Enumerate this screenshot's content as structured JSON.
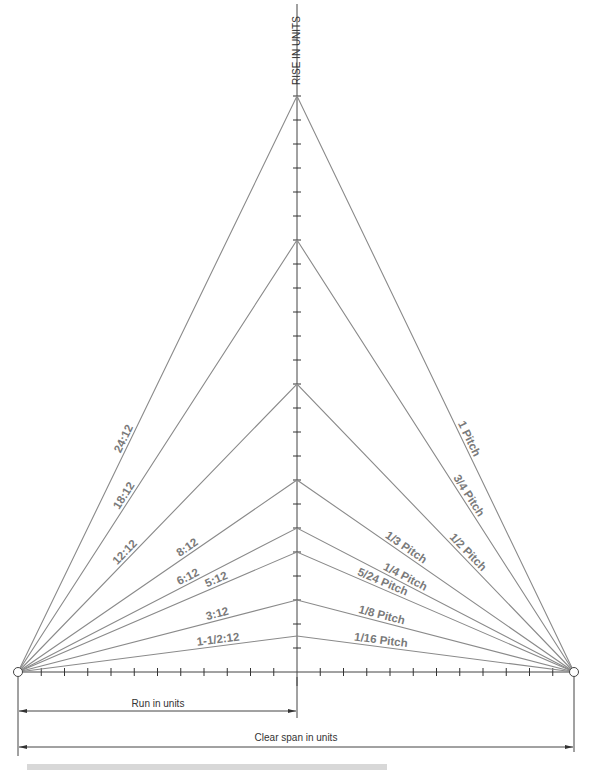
{
  "axis": {
    "vertical_label": "RISE IN UNITS"
  },
  "dimensions": {
    "run_label": "Run in units",
    "span_label": "Clear span in units"
  },
  "caption": {
    "note": "Figure caption clipped by bottom image edge; not legible"
  },
  "geometry": {
    "run_units": 12,
    "span_units": 24,
    "max_rise_units": 24
  },
  "left_labels": [
    {
      "text": "24:12",
      "rise": 24
    },
    {
      "text": "18:12",
      "rise": 18
    },
    {
      "text": "12:12",
      "rise": 12
    },
    {
      "text": "8:12",
      "rise": 8
    },
    {
      "text": "6:12",
      "rise": 6
    },
    {
      "text": "5:12",
      "rise": 5
    },
    {
      "text": "3:12",
      "rise": 3
    },
    {
      "text": "1-1/2:12",
      "rise": 1.5
    }
  ],
  "right_labels": [
    {
      "text": "1 Pitch",
      "rise": 24
    },
    {
      "text": "3/4 Pitch",
      "rise": 18
    },
    {
      "text": "1/2 Pitch",
      "rise": 12
    },
    {
      "text": "1/3 Pitch",
      "rise": 8
    },
    {
      "text": "1/4 Pitch",
      "rise": 6
    },
    {
      "text": "5/24 Pitch",
      "rise": 5
    },
    {
      "text": "1/8 Pitch",
      "rise": 3
    },
    {
      "text": "1/16 Pitch",
      "rise": 1.5
    }
  ],
  "colors": {
    "roof_line": "#8a8a8a",
    "axis_line": "#333333",
    "label": "#7a7a7a"
  }
}
